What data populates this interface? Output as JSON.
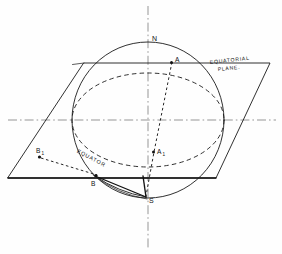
{
  "figure": {
    "background_color": "#fefefe",
    "ink_color": "#111111",
    "width": 282,
    "height": 254
  },
  "labels": {
    "north_pole": "N",
    "south_pole": "S",
    "point_a": "A",
    "point_a_sub": "1",
    "point_a_prime": "A",
    "point_b": "B",
    "point_b_prime": "B",
    "point_b_sub": "1",
    "equatorial_plane_line1": "EQUATORIAL",
    "equatorial_plane_line2": "PLANE.",
    "equator": "EQUATOR"
  },
  "geometry": {
    "sphere": {
      "center_x": 148,
      "center_y": 120,
      "radius_x": 76,
      "radius_y": 78
    },
    "equator_ellipse": {
      "center_x": 148,
      "center_y": 120,
      "radius_x": 76,
      "radius_y": 47,
      "style": "dashed"
    },
    "axis": {
      "x": 148,
      "top_y": 6,
      "bottom_y": 248,
      "style": "center-line"
    },
    "horizontal_centerline": {
      "y": 120,
      "left_x": 8,
      "right_x": 276,
      "style": "center-line"
    },
    "plane_parallelogram": {
      "corners": [
        {
          "x": 84,
          "y": 63
        },
        {
          "x": 270,
          "y": 63
        },
        {
          "x": 216,
          "y": 178
        },
        {
          "x": 8,
          "y": 178
        }
      ],
      "style": "solid"
    },
    "points": [
      {
        "name": "A",
        "x": 171,
        "y": 64
      },
      {
        "name": "A1",
        "x": 154,
        "y": 152
      },
      {
        "name": "B",
        "x": 96,
        "y": 176
      },
      {
        "name": "B1",
        "x": 38,
        "y": 156
      },
      {
        "name": "N",
        "x": 148,
        "y": 42
      },
      {
        "name": "S",
        "x": 146,
        "y": 196
      }
    ],
    "projection_rays": [
      {
        "from": "A",
        "to": "S",
        "style": "dotted"
      },
      {
        "from": "B1",
        "to": "B",
        "style": "dashed"
      }
    ]
  }
}
